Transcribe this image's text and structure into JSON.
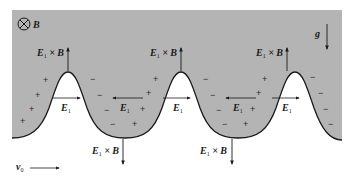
{
  "figure": {
    "colors": {
      "plasma_fill": "#b4b4b4",
      "vacuum_fill": "#ffffff",
      "line": "#1a1a1a"
    },
    "labels": {
      "b_field": "B",
      "gravity": "g",
      "velocity": "v",
      "velocity_sub": "0",
      "e_field": "E",
      "e_field_sub": "1",
      "drift": "× B"
    },
    "symbols": {
      "b_field_direction": "into-page (⊗)",
      "plus": "+",
      "minus": "−"
    },
    "crests": [
      {
        "x": 68,
        "drift_label": "E1 × B",
        "drift_direction": "up",
        "field_direction": "right"
      },
      {
        "x": 181,
        "drift_label": "E1 × B",
        "drift_direction": "up",
        "field_direction": "right"
      },
      {
        "x": 295,
        "drift_label": "E1 × B",
        "drift_direction": "up",
        "field_direction": "right"
      }
    ],
    "troughs": [
      {
        "x": 125,
        "drift_label": "E1 × B",
        "drift_direction": "down",
        "field_direction": "left"
      },
      {
        "x": 238,
        "drift_label": "E1 × B",
        "drift_direction": "down",
        "field_direction": "left"
      }
    ]
  }
}
